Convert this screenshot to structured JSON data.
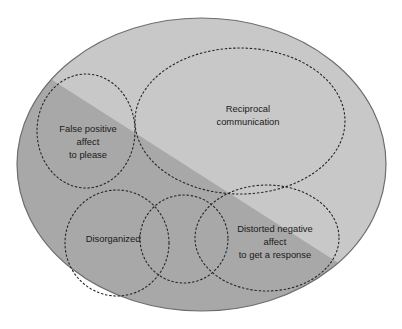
{
  "diagram": {
    "type": "venn-ellipses",
    "outer_shape": {
      "name": "outer-ellipse",
      "fill_light": "#c8c8c8",
      "fill_dark": "#a8a8a8",
      "stroke": "#6e6e6e"
    },
    "split": {
      "name": "diagonal-divider",
      "description": "diagonal band splitting the outer ellipse into a lighter upper-right half and a darker lower-left half"
    },
    "circle_stroke": "#262626",
    "regions": [
      {
        "id": "reciprocal-communication",
        "name": "region-reciprocal-communication",
        "lines": [
          "Reciprocal",
          "communication"
        ]
      },
      {
        "id": "false-positive-affect",
        "name": "region-false-positive-affect",
        "lines": [
          "False positive",
          "affect",
          "to please"
        ]
      },
      {
        "id": "disorganized",
        "name": "region-disorganized",
        "lines": [
          "Disorganized"
        ]
      },
      {
        "id": "distorted-negative-affect",
        "name": "region-distorted-negative-affect",
        "lines": [
          "Distorted negative",
          "affect",
          "to get a response"
        ]
      }
    ]
  }
}
